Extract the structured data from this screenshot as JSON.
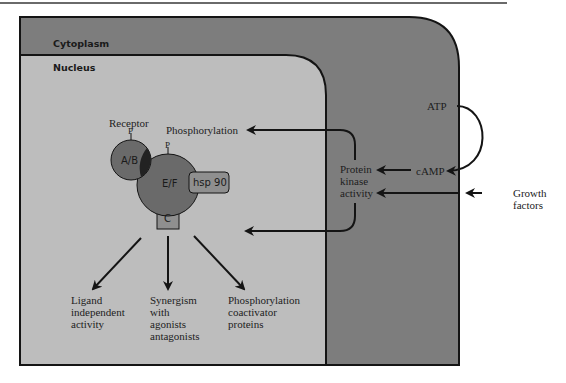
{
  "figure": {
    "regions": {
      "cytoplasm": "Cytoplasm",
      "nucleus": "Nucleus"
    },
    "receptor": {
      "label": "Receptor",
      "phospho_site_1": "P",
      "phospho_site_2": "P",
      "domain_ab": "A/B",
      "domain_ef": "E/F",
      "domain_c": "C",
      "chaperone": "hsp 90"
    },
    "signals": {
      "atp": "ATP",
      "camp": "cAMP",
      "protein_kinase": "Protein\nkinase\nactivity",
      "growth_factors": "Growth\nfactors",
      "phosphorylation": "Phosphorylation"
    },
    "outcomes": [
      {
        "label": "Ligand\nindependent\nactivity"
      },
      {
        "label": "Synergism\nwith\nagonists\nantagonists"
      },
      {
        "label": "Phosphorylation\ncoactivator\nproteins"
      }
    ],
    "colors": {
      "cytoplasm_fill": "#7d7d7d",
      "nucleus_fill": "#bdbdbd",
      "receptor_fill": "#6a6a6a",
      "box_fill": "#8f8f8f",
      "line": "#141414"
    }
  }
}
